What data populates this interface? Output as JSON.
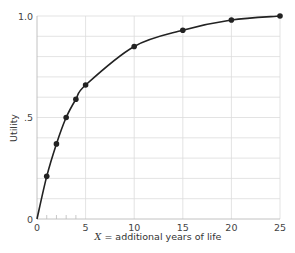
{
  "chart_data": {
    "type": "line",
    "title": "",
    "xlabel": "X = additional years of life",
    "xlabel_var": "X",
    "xlabel_rest": " = additional years of life",
    "ylabel": "Utility",
    "xlim": [
      0,
      25
    ],
    "ylim": [
      0,
      1.0
    ],
    "x_ticks": [
      0,
      5,
      10,
      15,
      20,
      25
    ],
    "x_tick_labels": [
      "0",
      "5",
      "10",
      "15",
      "20",
      "25"
    ],
    "x_minor_ticks": [
      1,
      2,
      3,
      4
    ],
    "y_ticks": [
      0,
      0.5,
      1.0
    ],
    "y_tick_labels": [
      "0",
      ".5",
      "1.0"
    ],
    "grid": true,
    "grid_x": [
      5,
      10,
      15,
      20,
      25
    ],
    "grid_y": [
      0.1,
      0.2,
      0.3,
      0.4,
      0.5,
      0.6,
      0.7,
      0.8,
      0.9,
      1.0
    ],
    "legend": null,
    "series": [
      {
        "name": "Utility curve",
        "x": [
          0,
          1,
          2,
          3,
          4,
          5,
          10,
          15,
          20,
          25
        ],
        "values": [
          0,
          0.21,
          0.37,
          0.5,
          0.59,
          0.66,
          0.85,
          0.93,
          0.98,
          1.0
        ],
        "markers": [
          false,
          true,
          true,
          true,
          true,
          true,
          true,
          true,
          true,
          true
        ],
        "color": "#222222"
      }
    ]
  }
}
